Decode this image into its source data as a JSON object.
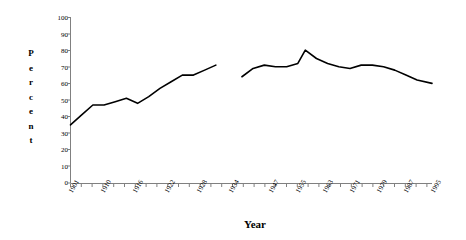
{
  "chart_data": {
    "type": "line",
    "title": "",
    "xlabel": "Year",
    "ylabel": "Percent",
    "ylim": [
      0,
      100
    ],
    "ytick_step": 10,
    "ytick_labels": [
      "100",
      "90",
      "80",
      "70",
      "60",
      "50",
      "40",
      "30",
      "20",
      "10",
      "0"
    ],
    "ytick_values": [
      100,
      90,
      80,
      70,
      60,
      50,
      40,
      30,
      20,
      10,
      0
    ],
    "xtick_labels": [
      "1901",
      "1910",
      "1916",
      "1922",
      "1928",
      "1934",
      "1947",
      "1955",
      "1963",
      "1971",
      "1979",
      "1987",
      "1995"
    ],
    "grid": false,
    "legend": null,
    "line_color": "#000000",
    "axis_color": "#808080",
    "series": [
      {
        "name": "segment-1",
        "x": [
          1901,
          1904,
          1907,
          1910,
          1913,
          1916,
          1919,
          1922,
          1925,
          1928,
          1931,
          1934,
          1937,
          1940
        ],
        "values": [
          35,
          41,
          47,
          47,
          49,
          51,
          48,
          52,
          57,
          61,
          65,
          65,
          68,
          71
        ]
      },
      {
        "name": "segment-2",
        "x": [
          1947,
          1950,
          1953,
          1956,
          1959,
          1962,
          1964,
          1967,
          1970,
          1973,
          1976,
          1979,
          1982,
          1985,
          1988,
          1991,
          1994,
          1998
        ],
        "values": [
          64,
          69,
          71,
          70,
          70,
          72,
          80,
          75,
          72,
          70,
          69,
          71,
          71,
          70,
          68,
          65,
          62,
          60
        ]
      }
    ],
    "gap_note": "break between 1940 and 1947"
  },
  "axes": {
    "y_title_letters": [
      "P",
      "e",
      "r",
      "c",
      "e",
      "n",
      "t"
    ],
    "x_title": "Year"
  }
}
